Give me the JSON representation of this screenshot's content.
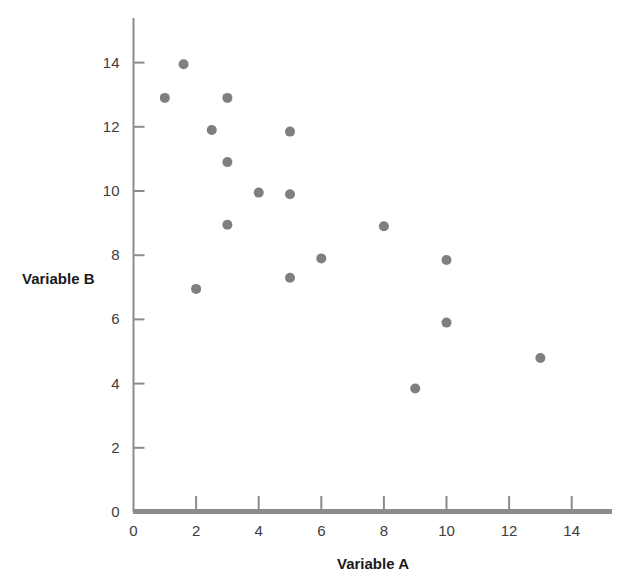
{
  "chart_data": {
    "type": "scatter",
    "title": "",
    "subtitle": "",
    "xlabel": "Variable A",
    "ylabel": "Variable B",
    "xlim": [
      0,
      15
    ],
    "ylim": [
      0,
      15
    ],
    "xticks": [
      0,
      2,
      4,
      6,
      8,
      10,
      12,
      14
    ],
    "xtick_labels": [
      "0",
      "2",
      "4",
      "6",
      "8",
      "10",
      "12",
      "14"
    ],
    "yticks": [
      0,
      2,
      4,
      6,
      8,
      10,
      12,
      14
    ],
    "ytick_labels": [
      "0",
      "2",
      "4",
      "6",
      "8",
      "10",
      "12",
      "14"
    ],
    "grid": false,
    "legend": null,
    "marker_color": "#7f7f7f",
    "axis_color": "#8c8c8c",
    "marker_size": 10,
    "series": [
      {
        "name": "Variable B vs Variable A",
        "points": [
          {
            "x": 1.0,
            "y": 12.9
          },
          {
            "x": 1.6,
            "y": 13.95
          },
          {
            "x": 2.0,
            "y": 6.95
          },
          {
            "x": 2.5,
            "y": 11.9
          },
          {
            "x": 3.0,
            "y": 12.9
          },
          {
            "x": 3.0,
            "y": 10.9
          },
          {
            "x": 3.0,
            "y": 8.95
          },
          {
            "x": 4.0,
            "y": 9.95
          },
          {
            "x": 5.0,
            "y": 11.85
          },
          {
            "x": 5.0,
            "y": 9.9
          },
          {
            "x": 5.0,
            "y": 7.3
          },
          {
            "x": 6.0,
            "y": 7.9
          },
          {
            "x": 8.0,
            "y": 8.9
          },
          {
            "x": 9.0,
            "y": 3.85
          },
          {
            "x": 10.0,
            "y": 7.85
          },
          {
            "x": 10.0,
            "y": 5.9
          },
          {
            "x": 13.0,
            "y": 4.8
          }
        ]
      }
    ]
  },
  "axes": {
    "x_title": "Variable A",
    "y_title": "Variable B"
  }
}
